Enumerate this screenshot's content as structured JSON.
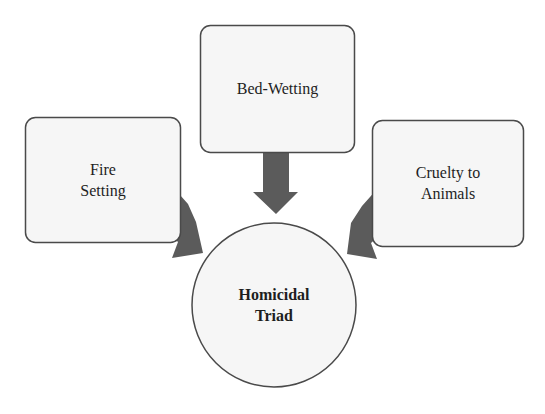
{
  "diagram": {
    "type": "converging-arrows",
    "colors": {
      "box_fill": "#f6f6f6",
      "box_stroke": "#4a4a4a",
      "arrow_fill": "#5b5b5b",
      "text": "#1e1e1e"
    },
    "nodes": {
      "bed_wetting": {
        "line1": "Bed-Wetting"
      },
      "fire_setting": {
        "line1": "Fire",
        "line2": "Setting"
      },
      "cruelty": {
        "line1": "Cruelty to",
        "line2": "Animals"
      },
      "center": {
        "line1": "Homicidal",
        "line2": "Triad"
      }
    },
    "edges": [
      {
        "from": "Fire Setting",
        "to": "Homicidal Triad"
      },
      {
        "from": "Bed-Wetting",
        "to": "Homicidal Triad"
      },
      {
        "from": "Cruelty to Animals",
        "to": "Homicidal Triad"
      }
    ]
  }
}
